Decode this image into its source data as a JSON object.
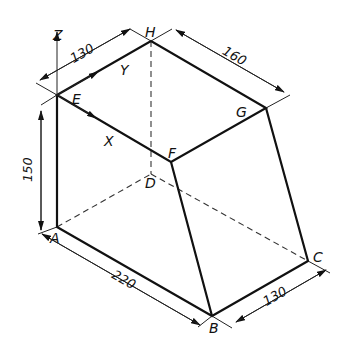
{
  "diagram": {
    "type": "isometric-drawing",
    "vertex_labels": {
      "A": "A",
      "B": "B",
      "C": "C",
      "D": "D",
      "E": "E",
      "F": "F",
      "G": "G",
      "H": "H"
    },
    "axis_labels": {
      "x": "X",
      "y": "Y",
      "z": "Z"
    },
    "dimensions": {
      "top_y_length": "130",
      "top_x_length": "160",
      "height": "150",
      "bottom_x_length": "220",
      "bottom_y_length": "130"
    },
    "colors": {
      "line": "#111111",
      "background": "#ffffff"
    }
  }
}
